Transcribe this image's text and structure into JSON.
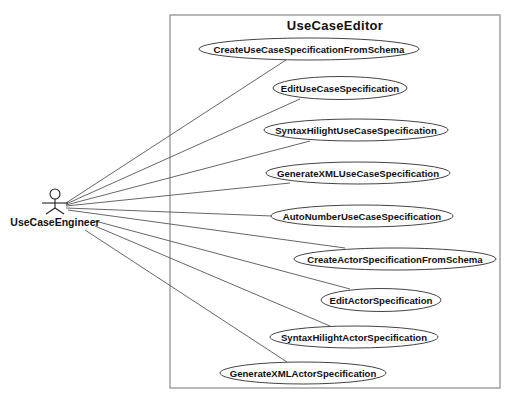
{
  "diagram": {
    "type": "uml-use-case",
    "system": {
      "name": "UseCaseEditor",
      "x": 170,
      "y": 15,
      "width": 330,
      "height": 373
    },
    "actor": {
      "name": "UseCaseEngineer",
      "head": {
        "cx": 55,
        "cy": 194,
        "r": 5
      },
      "label_x": 55,
      "label_y": 226
    },
    "use_cases": [
      {
        "label": "CreateUseCaseSpecificationFromSchema",
        "cx": 309,
        "cy": 49,
        "rx": 110,
        "ry": 11
      },
      {
        "label": "EditUseCaseSpecification",
        "cx": 340,
        "cy": 88,
        "rx": 67,
        "ry": 11.5
      },
      {
        "label": "SyntaxHilightUseCaseSpecification",
        "cx": 356,
        "cy": 130,
        "rx": 92,
        "ry": 11
      },
      {
        "label": "GenerateXMLUseCaseSpecification",
        "cx": 358,
        "cy": 173,
        "rx": 92,
        "ry": 11
      },
      {
        "label": "AutoNumberUseCaseSpecification",
        "cx": 362,
        "cy": 216,
        "rx": 91,
        "ry": 11
      },
      {
        "label": "CreateActorSpecificationFromSchema",
        "cx": 395,
        "cy": 259,
        "rx": 101,
        "ry": 11
      },
      {
        "label": "EditActorSpecification",
        "cx": 381,
        "cy": 300,
        "rx": 60,
        "ry": 11.5
      },
      {
        "label": "SyntaxHilightActorSpecification",
        "cx": 354,
        "cy": 337,
        "rx": 84,
        "ry": 11
      },
      {
        "label": "GenerateXMLActorSpecification",
        "cx": 303,
        "cy": 373,
        "rx": 83,
        "ry": 11
      }
    ],
    "associations": [
      {
        "from": "UseCaseEngineer",
        "to": "CreateUseCaseSpecificationFromSchema",
        "x1": 66,
        "y1": 203,
        "x2": 286,
        "y2": 60
      },
      {
        "from": "UseCaseEngineer",
        "to": "EditUseCaseSpecification",
        "x1": 66,
        "y1": 204,
        "x2": 300,
        "y2": 99
      },
      {
        "from": "UseCaseEngineer",
        "to": "SyntaxHilightUseCaseSpecification",
        "x1": 66,
        "y1": 205,
        "x2": 310,
        "y2": 141
      },
      {
        "from": "UseCaseEngineer",
        "to": "GenerateXMLUseCaseSpecification",
        "x1": 66,
        "y1": 206,
        "x2": 290,
        "y2": 183
      },
      {
        "from": "UseCaseEngineer",
        "to": "AutoNumberUseCaseSpecification",
        "x1": 66,
        "y1": 208,
        "x2": 272,
        "y2": 216
      },
      {
        "from": "UseCaseEngineer",
        "to": "CreateActorSpecificationFromSchema",
        "x1": 68,
        "y1": 210,
        "x2": 345,
        "y2": 248
      },
      {
        "from": "UseCaseEngineer",
        "to": "EditActorSpecification",
        "x1": 95,
        "y1": 221,
        "x2": 350,
        "y2": 289
      },
      {
        "from": "UseCaseEngineer",
        "to": "SyntaxHilightActorSpecification",
        "x1": 95,
        "y1": 226,
        "x2": 330,
        "y2": 326
      },
      {
        "from": "UseCaseEngineer",
        "to": "GenerateXMLActorSpecification",
        "x1": 85,
        "y1": 230,
        "x2": 287,
        "y2": 362
      }
    ],
    "colors": {
      "background": "#ffffff",
      "boundary_stroke": "#8a8a8a",
      "line": "#555555",
      "text": "#111111"
    }
  }
}
